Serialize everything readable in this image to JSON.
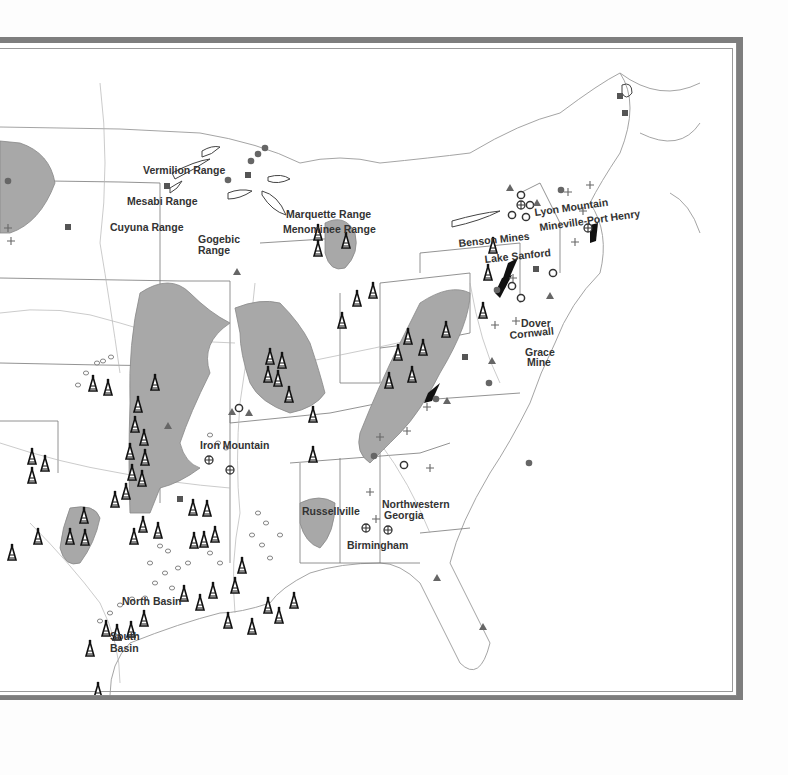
{
  "map": {
    "title": "Eastern United States mineral and energy resources",
    "colors": {
      "frame": "#7e7e7e",
      "basin_fill": "#a8a8a8",
      "outline": "#888888",
      "symbol": "#333333",
      "paper": "#ffffff"
    },
    "labels": {
      "vermilion": "Vermilion Range",
      "mesabi": "Mesabi Range",
      "cuyuna": "Cuyuna Range",
      "gogebic_1": "Gogebic",
      "gogebic_2": "Range",
      "marquette": "Marquette Range",
      "menominee": "Menominee Range",
      "lyon": "Lyon Mountain",
      "mineville": "Mineville-Port Henry",
      "benson": "Benson Mines",
      "lake_sanford": "Lake Sanford",
      "dover": "Dover",
      "cornwall": "Cornwall",
      "grace_1": "Grace",
      "grace_2": "Mine",
      "iron_mountain": "Iron Mountain",
      "russellville": "Russellville",
      "nw_georgia_1": "Northwestern",
      "nw_georgia_2": "Georgia",
      "birmingham": "Birmingham",
      "north_basin": "North Basin",
      "south_basin_1": "South",
      "south_basin_2": "Basin"
    },
    "symbol_legend": {
      "oil_derrick": "oil-field",
      "filled_circle": "mine-site",
      "open_circle": "iron-deposit",
      "crossed_circle": "mixed-deposit",
      "plus": "prospect",
      "triangle": "phosphate",
      "square": "mineral-deposit",
      "shaded_area": "coal-basin"
    }
  }
}
